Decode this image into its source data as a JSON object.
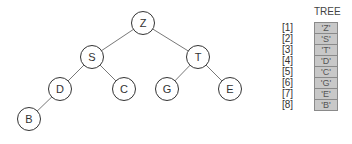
{
  "tree": {
    "nodes": [
      {
        "id": "Z",
        "label": "Z",
        "x": 143,
        "y": 23
      },
      {
        "id": "S",
        "label": "S",
        "x": 92,
        "y": 57
      },
      {
        "id": "T",
        "label": "T",
        "x": 198,
        "y": 57
      },
      {
        "id": "D",
        "label": "D",
        "x": 60,
        "y": 89
      },
      {
        "id": "C",
        "label": "C",
        "x": 124,
        "y": 89
      },
      {
        "id": "G",
        "label": "G",
        "x": 167,
        "y": 89
      },
      {
        "id": "E",
        "label": "E",
        "x": 230,
        "y": 89
      },
      {
        "id": "B",
        "label": "B",
        "x": 29,
        "y": 119
      }
    ],
    "edges": [
      [
        "Z",
        "S"
      ],
      [
        "Z",
        "T"
      ],
      [
        "S",
        "D"
      ],
      [
        "S",
        "C"
      ],
      [
        "T",
        "G"
      ],
      [
        "T",
        "E"
      ],
      [
        "D",
        "B"
      ]
    ]
  },
  "array": {
    "title": "TREE",
    "rows": [
      {
        "index": "[1]",
        "value": "'Z'"
      },
      {
        "index": "[2]",
        "value": "'S'"
      },
      {
        "index": "[3]",
        "value": "'T'"
      },
      {
        "index": "[4]",
        "value": "'D'"
      },
      {
        "index": "[5]",
        "value": "'C'"
      },
      {
        "index": "[6]",
        "value": "'G'"
      },
      {
        "index": "[7]",
        "value": "'E'"
      },
      {
        "index": "[8]",
        "value": "'B'"
      }
    ]
  },
  "colors": {
    "cell_fill": "#c8c8c8",
    "cell_border": "#8a8a8a",
    "edge": "#555555",
    "node_stroke": "#333333"
  }
}
